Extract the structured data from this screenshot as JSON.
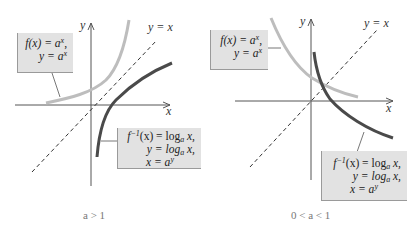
{
  "colors": {
    "exp_curve": "#bdbdbd",
    "log_curve": "#4a4a4a",
    "axis": "#555555",
    "diagonal": "#333333",
    "box_fill": "#e2e2e2"
  },
  "panels": [
    {
      "caption": "a > 1",
      "axis_x_label": "x",
      "axis_y_label": "y",
      "diagonal_label": "y = x",
      "exp_box": {
        "line1_pre": "f(x) = a",
        "line1_sup": "x",
        "line1_post": ",",
        "line2_pre": "y = a",
        "line2_sup": "x"
      },
      "log_box": {
        "line1_pre": "f",
        "line1_sup": "−1",
        "line1_mid": "(x) = log",
        "line1_sub": "a",
        "line1_post": " x,",
        "line2_pre": "y = log",
        "line2_sub": "a",
        "line2_post": " x,",
        "line3_pre": "x = a",
        "line3_sup": "y"
      }
    },
    {
      "caption": "0 < a < 1",
      "axis_x_label": "x",
      "axis_y_label": "y",
      "diagonal_label": "y = x",
      "exp_box": {
        "line1_pre": "f(x) = a",
        "line1_sup": "x",
        "line1_post": ",",
        "line2_pre": "y = a",
        "line2_sup": "x"
      },
      "log_box": {
        "line1_pre": "f",
        "line1_sup": "−1",
        "line1_mid": "(x) = log",
        "line1_sub": "a",
        "line1_post": " x,",
        "line2_pre": "y = log",
        "line2_sub": "a",
        "line2_post": " x,",
        "line3_pre": "x = a",
        "line3_sup": "y"
      }
    }
  ]
}
